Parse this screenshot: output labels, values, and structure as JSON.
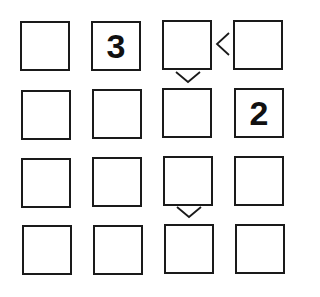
{
  "puzzle": {
    "type": "futoshiki",
    "size": 4,
    "grid": [
      [
        "",
        "3",
        "",
        ""
      ],
      [
        "",
        "",
        "",
        "2"
      ],
      [
        "",
        "",
        "",
        ""
      ],
      [
        "",
        "",
        "",
        ""
      ]
    ],
    "givens": [
      {
        "row": 0,
        "col": 1,
        "value": "3"
      },
      {
        "row": 1,
        "col": 3,
        "value": "2"
      }
    ],
    "constraints": [
      {
        "between": [
          [
            0,
            2
          ],
          [
            0,
            3
          ]
        ],
        "symbol": "<",
        "meaning": "r1c3 < r1c4"
      },
      {
        "between": [
          [
            0,
            2
          ],
          [
            1,
            2
          ]
        ],
        "symbol": "v",
        "meaning": "r1c3 > r2c3"
      },
      {
        "between": [
          [
            2,
            2
          ],
          [
            3,
            2
          ]
        ],
        "symbol": "v",
        "meaning": "r3c3 > r4c3"
      }
    ]
  },
  "colors": {
    "border": "#1a1a1a",
    "background": "#ffffff",
    "text": "#111111"
  }
}
